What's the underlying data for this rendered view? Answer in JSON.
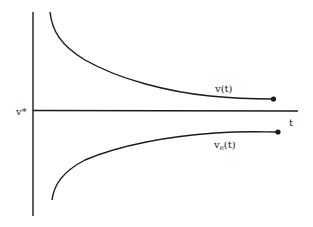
{
  "diagram": {
    "title": "",
    "axes": {
      "y_axis_label": "v*",
      "x_axis_label": "t"
    },
    "curves": [
      {
        "name": "upper-curve",
        "label": "v(t)",
        "label_sub": "",
        "behavior": "decreasing, approaches v* from above"
      },
      {
        "name": "lower-curve",
        "label": "v",
        "label_sub": "e",
        "label_suffix": "(t)",
        "behavior": "increasing, approaches v* from below"
      }
    ],
    "colors": {
      "line": "#1a1a1a",
      "background": "#ffffff"
    }
  }
}
